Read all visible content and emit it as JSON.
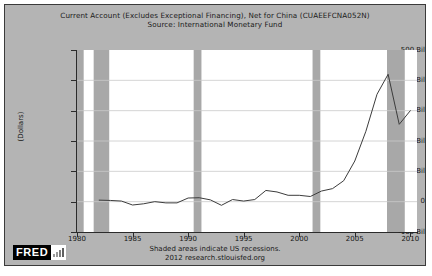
{
  "figure": {
    "background_color": "#b4b4b4",
    "plot_background_color": "#ffffff",
    "border_color": "#3a3a3a"
  },
  "logo": {
    "wordmark": "FRED",
    "bars_icon": "bar-chart-icon"
  },
  "footer": {
    "line1": "Shaded areas indicate US recessions.",
    "line2": "2012 research.stlouisfed.org"
  },
  "caption": {
    "cropped_text": ""
  },
  "chart_data": {
    "type": "line",
    "title": "Current Account (Excludes Exceptional Financing), Net for China (CUAEEFCNA052N)",
    "subtitle": "Source: International Monetary Fund",
    "xlabel": "",
    "ylabel": "(Dollars)",
    "xlim": [
      1980,
      2010.6
    ],
    "ylim": [
      -100,
      500
    ],
    "grid": true,
    "legend": false,
    "line_color": "#3c3c3c",
    "recession_band_color": "#a8a8a8",
    "y_ticks": [
      500,
      400,
      300,
      200,
      100,
      0,
      -100
    ],
    "y_tick_labels": [
      "500 Bil",
      "400 Bil",
      "300 Bil",
      "200 Bil",
      "100 Bil",
      "0",
      "-100 Bil"
    ],
    "x_ticks": [
      1980,
      1985,
      1990,
      1995,
      2000,
      2005,
      2010
    ],
    "x_tick_labels": [
      "1980",
      "1985",
      "1990",
      "1995",
      "2000",
      "2005",
      "2010"
    ],
    "series": [
      {
        "name": "Current Account, Net for China",
        "units": "Billions of Dollars",
        "x": [
          1982,
          1983,
          1984,
          1985,
          1986,
          1987,
          1988,
          1989,
          1990,
          1991,
          1992,
          1993,
          1994,
          1995,
          1996,
          1997,
          1998,
          1999,
          2000,
          2001,
          2002,
          2003,
          2004,
          2005,
          2006,
          2007,
          2008,
          2009,
          2010
        ],
        "values": [
          5,
          4,
          2,
          -11,
          -7,
          0,
          -4,
          -4,
          12,
          13,
          6,
          -12,
          7,
          2,
          7,
          37,
          32,
          21,
          21,
          17,
          35,
          43,
          69,
          134,
          232,
          354,
          420,
          255,
          300
        ]
      }
    ],
    "recessions": [
      {
        "label": "1980 recession",
        "start": 1980.0,
        "end": 1980.6
      },
      {
        "label": "1981-1982 recession",
        "start": 1981.5,
        "end": 1982.9
      },
      {
        "label": "1990-1991 recession",
        "start": 1990.5,
        "end": 1991.2
      },
      {
        "label": "2001 recession",
        "start": 2001.2,
        "end": 2001.9
      },
      {
        "label": "2007-2009 recession",
        "start": 2007.9,
        "end": 2009.5
      }
    ]
  }
}
